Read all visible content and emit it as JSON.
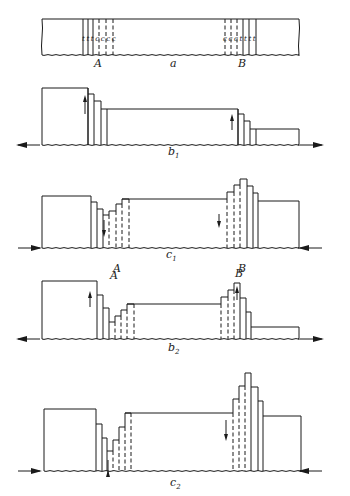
{
  "figure": {
    "panels": [
      {
        "id": "a",
        "label": "a",
        "label_pos": [
          170,
          67
        ],
        "point_labels": [
          {
            "text": "A",
            "pos": [
              94,
              67
            ]
          },
          {
            "text": "B",
            "pos": [
              238,
              67
            ]
          }
        ],
        "bar": {
          "x0": 42,
          "x1": 299,
          "y_top": 19,
          "y_bot": 55
        },
        "solid_lines_A": [
          83,
          88,
          93
        ],
        "dashed_lines_A": [
          99,
          106,
          113
        ],
        "dashed_lines_B": [
          225,
          231,
          237
        ],
        "solid_lines_B": [
          243,
          249,
          256
        ],
        "zone_letters_A": "t t t c c c c",
        "zone_letters_B": "c c c t t t t",
        "zone_letter_y": 41
      },
      {
        "id": "b1",
        "label": "b",
        "subscript": "1",
        "label_pos": [
          168,
          155
        ],
        "baseline_y": 145,
        "arrows": [
          {
            "dir": "left",
            "x": 18,
            "y": 145
          },
          {
            "dir": "right",
            "x": 322,
            "y": 145
          }
        ],
        "left_block": {
          "x0": 42,
          "x1": 88,
          "y_top": 88
        },
        "left_steps": [
          {
            "x": 88,
            "top": 94
          },
          {
            "x": 94,
            "top": 101
          },
          {
            "x": 101,
            "top": 109
          },
          {
            "x": 107,
            "top": 109
          }
        ],
        "middle": {
          "x0": 107,
          "x1": 238,
          "y_top": 109
        },
        "right_steps": [
          {
            "x": 238,
            "top": 114
          },
          {
            "x": 244,
            "top": 121
          },
          {
            "x": 250,
            "top": 129
          },
          {
            "x": 256,
            "top": 129
          }
        ],
        "right_block": {
          "x0": 256,
          "x1": 299,
          "y_top": 129
        },
        "motion_arrows": [
          {
            "x": 85,
            "y1": 114,
            "y2": 96,
            "dir": "up"
          },
          {
            "x": 232,
            "y1": 130,
            "y2": 115,
            "dir": "up"
          }
        ]
      },
      {
        "id": "c1",
        "label": "c",
        "subscript": "1",
        "label_pos": [
          166,
          258
        ],
        "baseline_y": 248,
        "arrows": [
          {
            "dir": "right-in",
            "x": 18,
            "y": 248
          },
          {
            "dir": "left-in",
            "x": 322,
            "y": 248
          }
        ],
        "point_labels": [
          {
            "text": "A",
            "pos": [
              113,
              272
            ]
          },
          {
            "text": "B",
            "pos": [
              238,
              272
            ]
          }
        ],
        "left_block": {
          "x0": 42,
          "x1": 91,
          "y_top": 196
        },
        "profile_A": [
          [
            91,
            196
          ],
          [
            91,
            202
          ],
          [
            97,
            202
          ],
          [
            97,
            209
          ],
          [
            103,
            209
          ],
          [
            103,
            215
          ],
          [
            109,
            215
          ],
          [
            109,
            211
          ],
          [
            116,
            211
          ],
          [
            116,
            204
          ],
          [
            122,
            204
          ],
          [
            122,
            199
          ],
          [
            129,
            199
          ]
        ],
        "solid_A": [
          91,
          97,
          103
        ],
        "dashed_A": [
          109,
          116,
          122
        ],
        "middle": {
          "x0": 122,
          "x1": 227,
          "y_top": 199
        },
        "profile_B": [
          [
            227,
            199
          ],
          [
            227,
            192
          ],
          [
            234,
            192
          ],
          [
            234,
            185
          ],
          [
            240,
            185
          ],
          [
            240,
            179
          ],
          [
            247,
            179
          ],
          [
            247,
            186
          ],
          [
            253,
            186
          ],
          [
            253,
            193
          ],
          [
            258,
            193
          ],
          [
            258,
            201
          ]
        ],
        "dashed_B": [
          227,
          234,
          240
        ],
        "solid_B": [
          247,
          253,
          258
        ],
        "right_block": {
          "x0": 258,
          "x1": 299,
          "y_top": 201
        },
        "motion_arrows": [
          {
            "x": 104,
            "y1": 220,
            "y2": 236,
            "dir": "down"
          },
          {
            "x": 219,
            "y1": 214,
            "y2": 227,
            "dir": "down"
          }
        ]
      },
      {
        "id": "b2",
        "label": "b",
        "subscript": "2",
        "label_pos": [
          168,
          351
        ],
        "baseline_y": 339,
        "arrows": [
          {
            "dir": "left",
            "x": 18,
            "y": 339
          },
          {
            "dir": "right",
            "x": 322,
            "y": 339
          }
        ],
        "left_block": {
          "x0": 42,
          "x1": 97,
          "y_top": 281
        },
        "profile_A": [
          [
            97,
            281
          ],
          [
            97,
            295
          ],
          [
            103,
            295
          ],
          [
            103,
            308
          ],
          [
            109,
            308
          ],
          [
            109,
            322
          ],
          [
            115,
            322
          ],
          [
            115,
            316
          ],
          [
            121,
            316
          ],
          [
            121,
            310
          ],
          [
            127,
            310
          ],
          [
            127,
            304
          ],
          [
            134,
            304
          ]
        ],
        "solid_A": [
          97,
          103,
          109
        ],
        "dashed_A": [
          115,
          121,
          127
        ],
        "middle": {
          "x0": 127,
          "x1": 221,
          "y_top": 304
        },
        "profile_B": [
          [
            221,
            304
          ],
          [
            221,
            297
          ],
          [
            228,
            297
          ],
          [
            228,
            290
          ],
          [
            234,
            290
          ],
          [
            234,
            283
          ],
          [
            240,
            283
          ],
          [
            240,
            298
          ],
          [
            246,
            298
          ],
          [
            246,
            312
          ],
          [
            251,
            312
          ],
          [
            251,
            327
          ]
        ],
        "dashed_B": [
          221,
          228,
          234
        ],
        "solid_B": [
          240,
          246,
          251
        ],
        "right_block": {
          "x0": 251,
          "x1": 299,
          "y_top": 327
        },
        "motion_arrows": [
          {
            "x": 90,
            "y1": 307,
            "y2": 292,
            "dir": "up"
          },
          {
            "x": 237,
            "y1": 300,
            "y2": 287,
            "dir": "up"
          }
        ]
      },
      {
        "id": "c2",
        "label": "c",
        "subscript": "2",
        "label_pos": [
          170,
          486
        ],
        "baseline_y": 471,
        "arrows": [
          {
            "dir": "right-in",
            "x": 18,
            "y": 471
          },
          {
            "dir": "left-in",
            "x": 322,
            "y": 471
          }
        ],
        "left_block": {
          "x0": 44,
          "x1": 96,
          "y_top": 409
        },
        "profile_A": [
          [
            96,
            409
          ],
          [
            96,
            424
          ],
          [
            102,
            424
          ],
          [
            102,
            438
          ],
          [
            107,
            438
          ],
          [
            107,
            451
          ],
          [
            113,
            451
          ],
          [
            113,
            440
          ],
          [
            119,
            440
          ],
          [
            119,
            427
          ],
          [
            125,
            427
          ],
          [
            125,
            413
          ],
          [
            131,
            413
          ]
        ],
        "solid_A": [
          96,
          102,
          107
        ],
        "dashed_A": [
          113,
          119,
          125
        ],
        "middle": {
          "x0": 125,
          "x1": 233,
          "y_top": 413
        },
        "profile_B": [
          [
            233,
            413
          ],
          [
            233,
            399
          ],
          [
            239,
            399
          ],
          [
            239,
            386
          ],
          [
            245,
            386
          ],
          [
            245,
            373
          ],
          [
            251,
            373
          ],
          [
            251,
            387
          ],
          [
            258,
            387
          ],
          [
            258,
            401
          ],
          [
            263,
            401
          ],
          [
            263,
            416
          ]
        ],
        "dashed_B": [
          233,
          239,
          245
        ],
        "solid_B": [
          251,
          258,
          263
        ],
        "right_block": {
          "x0": 263,
          "x1": 301,
          "y_top": 416
        },
        "motion_arrows": [
          {
            "x": 108,
            "y1": 460,
            "y2": 471,
            "dir": "up-small"
          },
          {
            "x": 226,
            "y1": 420,
            "y2": 440,
            "dir": "down"
          }
        ]
      }
    ]
  }
}
